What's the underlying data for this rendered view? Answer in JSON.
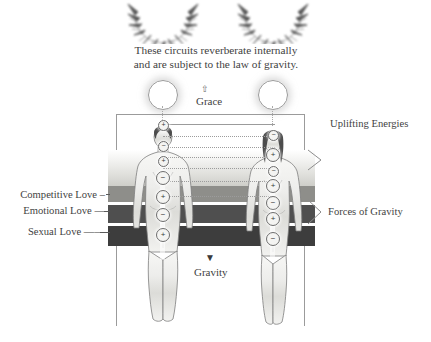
{
  "diagram": {
    "caption_line1": "These circuits reverberate internally",
    "caption_line2": "and are subject to the law of gravity.",
    "grace_label": "Grace",
    "gravity_label": "Gravity",
    "uplifting_label": "Uplifting Energies",
    "forces_label": "Forces of Gravity"
  },
  "left_labels": [
    {
      "text": "Competitive Love",
      "dash": "–"
    },
    {
      "text": "Emotional Love",
      "dash": "—"
    },
    {
      "text": "Sexual Love",
      "dash": "——"
    }
  ],
  "bands": [
    {
      "name": "competitive-love-band",
      "color": "#8e8e8a"
    },
    {
      "name": "emotional-love-band",
      "color": "#4f4f4f"
    },
    {
      "name": "sexual-love-band",
      "color": "#3d3d3d"
    }
  ],
  "figures": {
    "left": {
      "name": "male-figure",
      "polarity": [
        "+",
        "−",
        "+",
        "−",
        "+",
        "−",
        "+"
      ]
    },
    "right": {
      "name": "female-figure",
      "polarity": [
        "−",
        "+",
        "−",
        "+",
        "−",
        "+",
        "−"
      ]
    }
  },
  "arrows": {
    "grace_arrow": "⇧",
    "gravity_arrow": "▼"
  },
  "colors": {
    "ink": "#3f3f3f",
    "line": "#9b9b9b",
    "band_light": "#8e8e8a",
    "band_mid": "#4f4f4f",
    "band_dark": "#3d3d3d",
    "background": "#ffffff"
  }
}
